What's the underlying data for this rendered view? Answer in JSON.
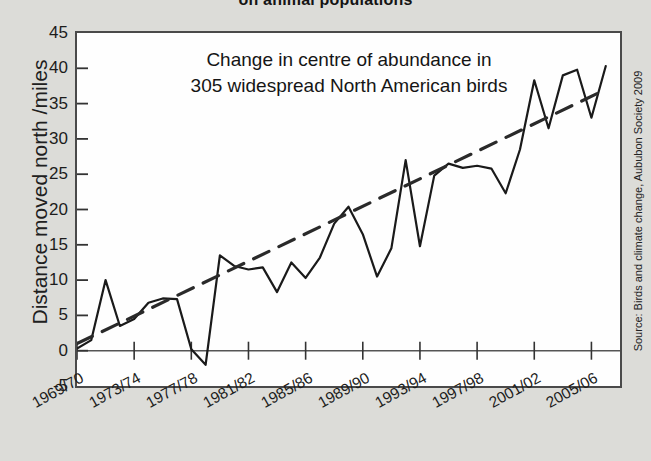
{
  "title": "on animal populations",
  "source_credit": "Source: Birds and climate change, Aububon Society 2009",
  "annotation": {
    "line1": "Change in centre of abundance in",
    "line2": "305 widespread North American birds"
  },
  "colors": {
    "background": "#dcdcd8",
    "plot_background": "#fefefe",
    "frame": "#4a4a4a",
    "series_line": "#1a1a1a",
    "trend_line": "#2a2a2a",
    "zero_line": "#555555",
    "text": "#1a1a1a"
  },
  "chart_data": {
    "type": "line",
    "title": "on animal populations",
    "xlabel": "",
    "ylabel": "Distance moved north  /miles",
    "ylim": [
      -5,
      45
    ],
    "ytick_values": [
      45,
      40,
      35,
      30,
      25,
      20,
      15,
      10,
      5,
      0,
      -5
    ],
    "ytick_labels": [
      "45",
      "40",
      "35",
      "30",
      "25",
      "20",
      "15",
      "10",
      "5",
      "0",
      "-5"
    ],
    "ystep": 5,
    "grid": false,
    "legend": "none",
    "xtick_labels": [
      "1969/70",
      "1973/74",
      "1977/78",
      "1981/82",
      "1985/86",
      "1989/90",
      "1993/94",
      "1997/98",
      "2001/02",
      "2005/06"
    ],
    "xtick_years": [
      1969,
      1973,
      1977,
      1981,
      1985,
      1989,
      1993,
      1997,
      2001,
      2005
    ],
    "xlim_years": [
      1969,
      2007
    ],
    "series": [
      {
        "name": "Distance moved north",
        "style": "solid",
        "x": [
          1969,
          1970,
          1971,
          1972,
          1973,
          1974,
          1975,
          1976,
          1977,
          1978,
          1979,
          1980,
          1981,
          1982,
          1983,
          1984,
          1985,
          1986,
          1987,
          1988,
          1989,
          1990,
          1991,
          1992,
          1993,
          1994,
          1995,
          1996,
          1997,
          1998,
          1999,
          2000,
          2001,
          2002,
          2003,
          2004,
          2005,
          2006
        ],
        "values": [
          0.3,
          1.5,
          10.0,
          3.5,
          4.5,
          6.8,
          7.4,
          7.3,
          0.2,
          -2.0,
          13.5,
          12.0,
          11.5,
          11.8,
          8.3,
          12.5,
          10.3,
          13.2,
          18.0,
          20.4,
          16.5,
          10.5,
          14.5,
          27.0,
          14.8,
          24.8,
          26.5,
          25.9,
          26.2,
          25.8,
          22.3,
          28.5,
          38.3,
          31.5,
          39.0,
          39.8,
          33.0,
          40.3
        ]
      },
      {
        "name": "Linear trend",
        "style": "dashed",
        "x": [
          1969,
          2006
        ],
        "values": [
          1.0,
          37.0
        ]
      }
    ]
  }
}
